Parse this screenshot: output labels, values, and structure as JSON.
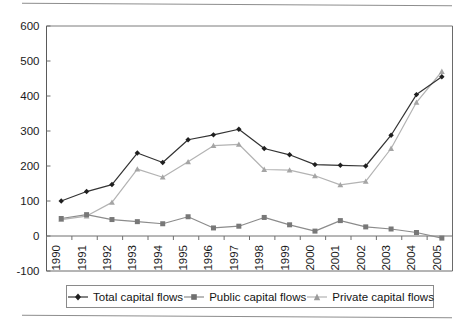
{
  "chart_data": {
    "type": "line",
    "title": "",
    "xlabel": "",
    "ylabel": "",
    "categories": [
      "1990",
      "1991",
      "1992",
      "1993",
      "1994",
      "1995",
      "1996",
      "1997",
      "1998",
      "1999",
      "2000",
      "2001",
      "2002",
      "2003",
      "2004",
      "2005"
    ],
    "x": [
      1990,
      1991,
      1992,
      1993,
      1994,
      1995,
      1996,
      1997,
      1998,
      1999,
      2000,
      2001,
      2002,
      2003,
      2004,
      2005
    ],
    "ylim": [
      -100,
      600
    ],
    "yticks": [
      -100,
      0,
      100,
      200,
      300,
      400,
      500,
      600
    ],
    "ytick_labels": [
      "-100",
      "0",
      "100",
      "200",
      "300",
      "400",
      "500",
      "600"
    ],
    "grid": false,
    "legend_position": "bottom",
    "series": [
      {
        "name": "Total capital flows",
        "color": "#333333",
        "marker": "diamond",
        "values": [
          100,
          127,
          147,
          237,
          210,
          275,
          289,
          305,
          250,
          232,
          204,
          202,
          200,
          288,
          404,
          455
        ]
      },
      {
        "name": "Public capital flows",
        "color": "#8c8c8c",
        "marker": "square",
        "values": [
          50,
          61,
          47,
          41,
          35,
          55,
          23,
          28,
          53,
          32,
          14,
          44,
          26,
          20,
          10,
          -6
        ]
      },
      {
        "name": "Private capital flows",
        "color": "#b3b3b3",
        "marker": "triangle",
        "values": [
          47,
          57,
          96,
          191,
          168,
          212,
          258,
          262,
          190,
          188,
          172,
          146,
          156,
          250,
          382,
          470
        ]
      }
    ]
  },
  "legend": {
    "entries": [
      {
        "label": "Total capital flows",
        "icon": "line-diamond-marker-icon"
      },
      {
        "label": "Public capital flows",
        "icon": "line-square-marker-icon"
      },
      {
        "label": "Private capital flows",
        "icon": "line-triangle-marker-icon"
      }
    ]
  }
}
